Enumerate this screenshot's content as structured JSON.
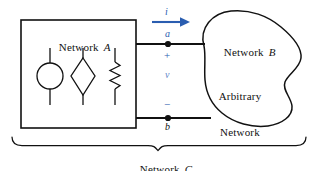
{
  "figure": {
    "type": "circuit-diagram",
    "colors": {
      "line": "#111111",
      "annotation_blue": "#2a5db0",
      "annotation_blue_faint": "#5f86c9",
      "background": "#ffffff"
    }
  },
  "network_a": {
    "label": "Network",
    "label_italic": "A",
    "elements": [
      {
        "name": "independent-source",
        "shape": "circle"
      },
      {
        "name": "dependent-source",
        "shape": "diamond"
      },
      {
        "name": "resistor",
        "shape": "zigzag"
      }
    ]
  },
  "network_b": {
    "label": "Network",
    "label_italic": "B",
    "sublabel_line1": "Arbitrary",
    "sublabel_line2": "Network",
    "shape": "arbitrary-blob"
  },
  "network_c": {
    "label": "Network",
    "label_italic": "C",
    "brace": "wide-curly-brace"
  },
  "terminals": {
    "top": {
      "node_label": "a",
      "sign": "+"
    },
    "bottom": {
      "node_label": "b",
      "sign": "−"
    }
  },
  "annotations": {
    "current_symbol": "i",
    "current_direction": "right",
    "voltage_symbol": "v"
  }
}
